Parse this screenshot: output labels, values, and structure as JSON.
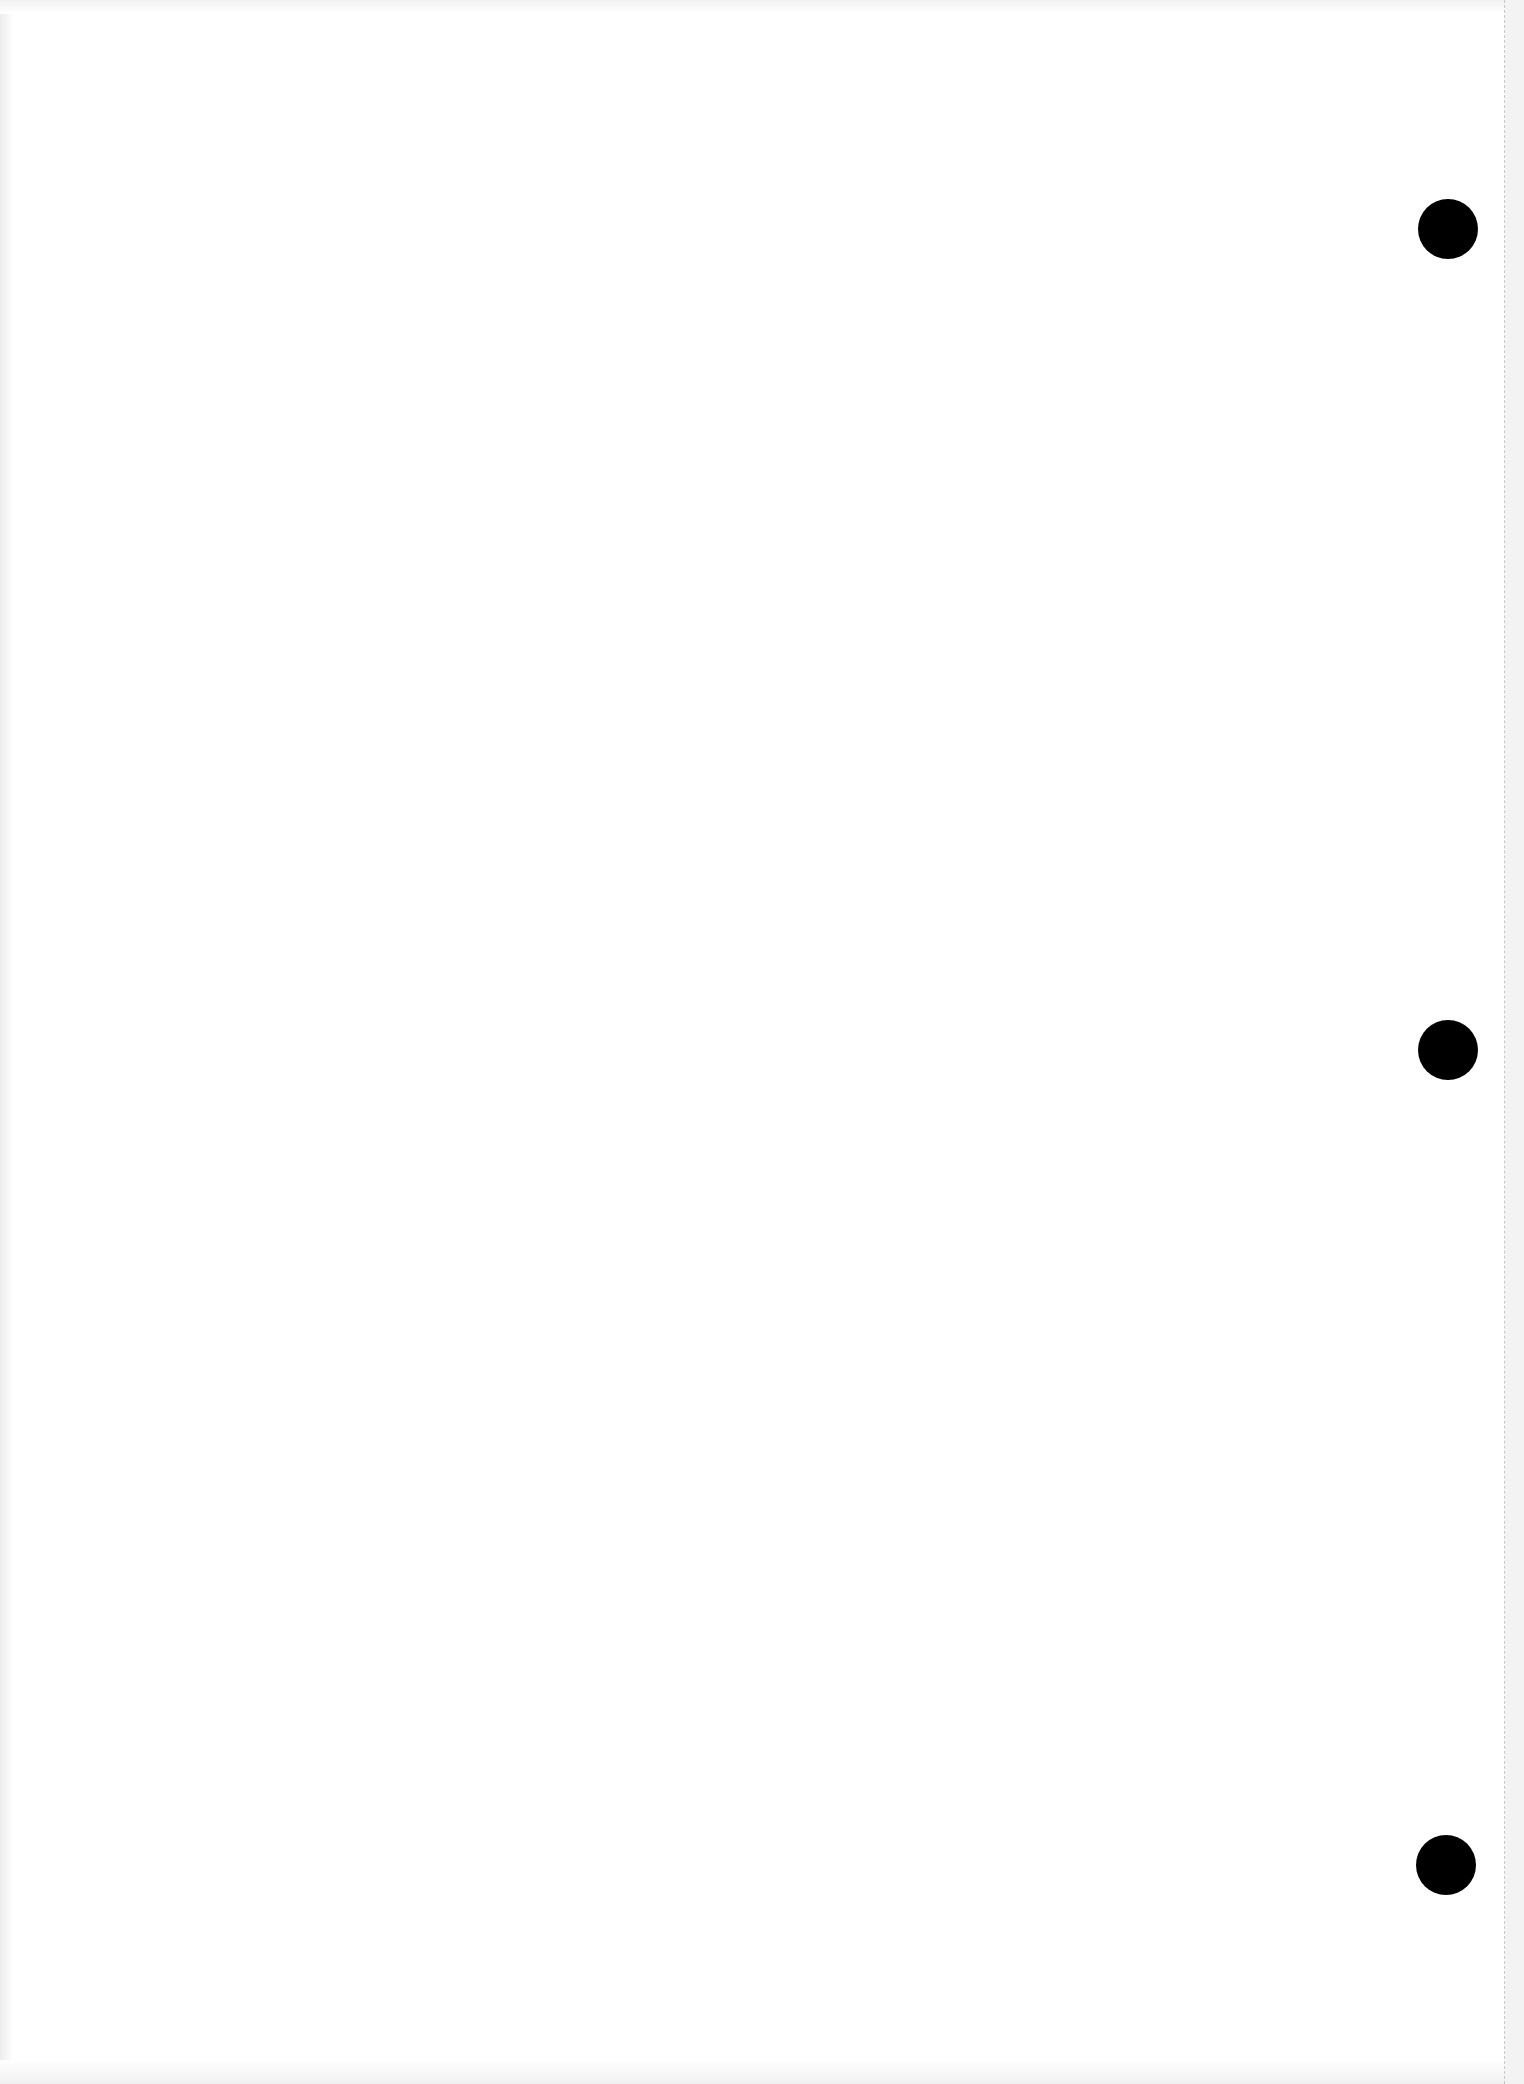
{
  "page": {
    "type": "blank-scanned-sheet",
    "background_color": "#ffffff",
    "text": ""
  },
  "perforation": {
    "x": 1504,
    "color": "#c8c8c8"
  },
  "right_strip": {
    "width": 19,
    "color": "#f3f3f3"
  },
  "punch_holes": [
    {
      "cx": 1448,
      "cy": 229,
      "r": 30,
      "color": "#000000"
    },
    {
      "cx": 1448,
      "cy": 1050,
      "r": 30,
      "color": "#000000"
    },
    {
      "cx": 1446,
      "cy": 1865,
      "r": 30,
      "color": "#000000"
    }
  ]
}
